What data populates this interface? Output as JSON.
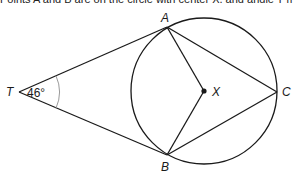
{
  "header_fragment": "Points A and B are on the circle with center X, and angle T measures 46°.",
  "diagram": {
    "circle": {
      "center": "X",
      "cx": 204,
      "cy": 91,
      "r": 73
    },
    "points": {
      "A": {
        "label": "A",
        "x": 167,
        "y": 27
      },
      "B": {
        "label": "B",
        "x": 167,
        "y": 155
      },
      "C": {
        "label": "C",
        "x": 277,
        "y": 92
      },
      "X": {
        "label": "X",
        "x": 204,
        "y": 91
      },
      "T": {
        "label": "T",
        "x": 19,
        "y": 92
      }
    },
    "segments": [
      "TA",
      "TB",
      "AX",
      "BX",
      "AC",
      "BC"
    ],
    "angle_T_label": "46°",
    "colors": {
      "line": "#1a1a1a",
      "arc": "#9a9a9a",
      "background": "#ffffff"
    }
  }
}
